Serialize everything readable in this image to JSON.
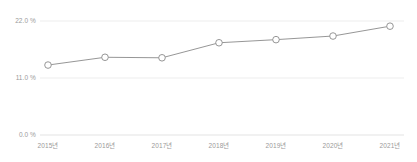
{
  "chart_data": {
    "type": "line",
    "title": "",
    "subtitle": "",
    "xlabel": "",
    "ylabel": "",
    "categories": [
      "2015년",
      "2016년",
      "2017년",
      "2018년",
      "2019년",
      "2020년",
      "2021년"
    ],
    "series": [
      {
        "name": "",
        "values": [
          13.5,
          15.0,
          14.9,
          17.8,
          18.4,
          19.1,
          21.0
        ]
      }
    ],
    "ylim": [
      0.0,
      22.0
    ],
    "y_ticks": [
      0.0,
      11.0,
      22.0
    ],
    "y_tick_labels": [
      "0.0 %",
      "11.0 %",
      "22.0 %"
    ],
    "x_tick_labels": [
      "2015년",
      "2016년",
      "2017년",
      "2018년",
      "2019년",
      "2020년",
      "2021년"
    ],
    "grid": true,
    "legend": false,
    "legend_position": "none",
    "colors": {
      "line": "#8a8a8a",
      "marker_fill": "#ffffff",
      "marker_stroke": "#8a8a8a",
      "gridline": "#e8e8e8",
      "axis_text": "#9a9a9a",
      "background": "#ffffff"
    },
    "marker": "circle-open",
    "annotations": []
  }
}
